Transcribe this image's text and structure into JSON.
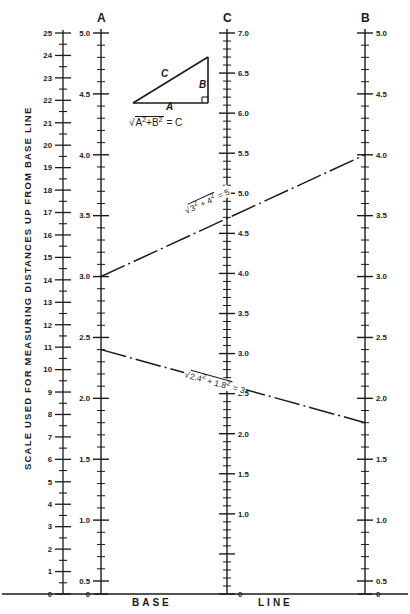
{
  "chart_data": {
    "type": "line",
    "vertical_axis_label": "SCALE USED FOR MEASURING DISTANCES UP FROM BASE LINE",
    "baseline_words": [
      "BASE",
      "LINE"
    ],
    "diagram": {
      "triangle_side_labels": [
        "C",
        "B",
        "A"
      ],
      "formula_parts": {
        "radical": "√",
        "a_term": "A",
        "exp1": "2",
        "plus": "+",
        "b_term": "B",
        "exp2": "2",
        "equals": "= C"
      }
    },
    "scales": [
      {
        "id": "ruler",
        "name": "distance-ruler",
        "header": "",
        "min": 0,
        "max": 25,
        "label_side": "left",
        "major_step": 1,
        "minor_step": 0.5,
        "labels": [
          "0",
          "1",
          "2",
          "3",
          "4",
          "5",
          "6",
          "7",
          "8",
          "9",
          "10",
          "11",
          "12",
          "13",
          "14",
          "15",
          "16",
          "17",
          "18",
          "19",
          "20",
          "21",
          "22",
          "23",
          "24",
          "25"
        ]
      },
      {
        "id": "A",
        "name": "scale-a",
        "header": "A",
        "min": 0.5,
        "max": 5.0,
        "label_side": "left",
        "major_step": 0.5,
        "minor_step": 0.1,
        "labels": [
          "0.5",
          "1.0",
          "1.5",
          "2.0",
          "2.5",
          "3.0",
          "3.5",
          "4.0",
          "4.5",
          "5.0"
        ],
        "zero_label": "0"
      },
      {
        "id": "C",
        "name": "scale-c",
        "header": "C",
        "min": 0.0,
        "max": 7.0,
        "label_side": "right",
        "major_step": 0.5,
        "minor_step": 0.1,
        "labels": [
          "0",
          "1.0",
          "1.5",
          "2.0",
          "2.5",
          "3.0",
          "3.5",
          "4.0",
          "4.5",
          "5.0",
          "5.5",
          "6.0",
          "6.5",
          "7.0"
        ]
      },
      {
        "id": "B",
        "name": "scale-b",
        "header": "B",
        "min": 0.5,
        "max": 5.0,
        "label_side": "right",
        "major_step": 0.5,
        "minor_step": 0.1,
        "labels": [
          "0.5",
          "1.0",
          "1.5",
          "2.0",
          "2.5",
          "3.0",
          "3.5",
          "4.0",
          "4.5",
          "5.0"
        ],
        "zero_label": "0"
      }
    ],
    "isopleths": [
      {
        "name": "example-3-4-5",
        "A": 3.0,
        "C": 5.0,
        "B": 4.0,
        "annotation": "√3² + 4² = 5",
        "annot_parts": {
          "rad": "√",
          "a": "3",
          "e1": "2",
          "plus": "+",
          "b": "4",
          "e2": "2",
          "eq": "= 5"
        }
      },
      {
        "name": "example-2_4-1_8-3",
        "A": 2.4,
        "C": 3.0,
        "B": 1.8,
        "annotation": "√2.4² + 1.8² = 3",
        "annot_parts": {
          "rad": "√",
          "a": "2.4",
          "e1": "2",
          "plus": "+",
          "b": "1.8",
          "e2": "2",
          "eq": "= 3"
        }
      }
    ],
    "colors": {
      "ink": "#1a1a1a",
      "background": "#ffffff"
    }
  }
}
